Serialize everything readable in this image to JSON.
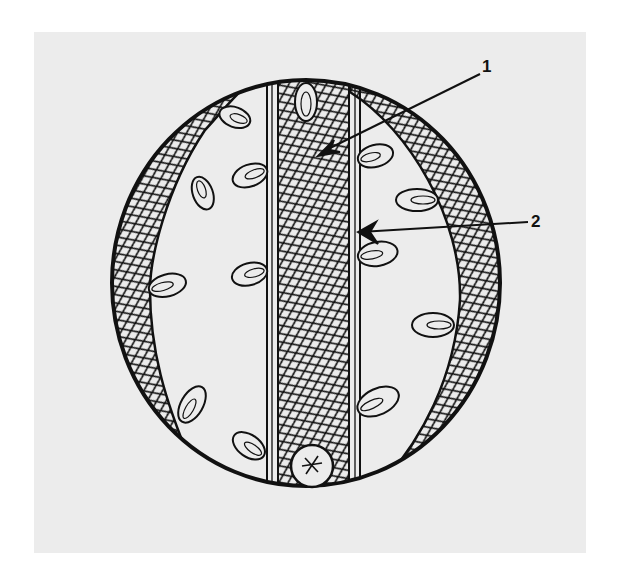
{
  "figure": {
    "background_color": "#ececec",
    "ink_color": "#111111",
    "structures": [
      {
        "id": "outer-wall",
        "description": "elliptical outer wall"
      },
      {
        "id": "left-crescent",
        "description": "cross-hatched crescent band on left"
      },
      {
        "id": "right-crescent",
        "description": "cross-hatched crescent band on right"
      },
      {
        "id": "central-band",
        "description": "vertical cross-hatched central band between parallel double lines"
      },
      {
        "id": "petal-bodies",
        "description": "leaf/petal shaped bodies attached along bands"
      },
      {
        "id": "basal-body",
        "description": "small circle with star at bottom"
      }
    ]
  },
  "labels": [
    {
      "id": "1",
      "text": "1",
      "target": "central-band"
    },
    {
      "id": "2",
      "text": "2",
      "target": "central-band-edge"
    }
  ]
}
